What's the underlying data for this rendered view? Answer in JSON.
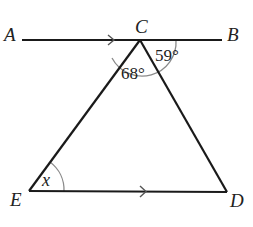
{
  "diagram": {
    "type": "geometry",
    "points": {
      "A": {
        "label": "A",
        "x": 22,
        "y": 40
      },
      "B": {
        "label": "B",
        "x": 222,
        "y": 40
      },
      "C": {
        "label": "C",
        "x": 140,
        "y": 40
      },
      "D": {
        "label": "D",
        "x": 227,
        "y": 192
      },
      "E": {
        "label": "E",
        "x": 29,
        "y": 191
      }
    },
    "angles": {
      "ECD": {
        "label": "68°",
        "value": 68
      },
      "DCB": {
        "label": "59°",
        "value": 59
      },
      "CED": {
        "label": "x",
        "value": null
      }
    },
    "parallel_lines": [
      "AB",
      "ED"
    ],
    "colors": {
      "line": "#1a1a1a",
      "arc": "#888888",
      "text": "#222222"
    }
  }
}
